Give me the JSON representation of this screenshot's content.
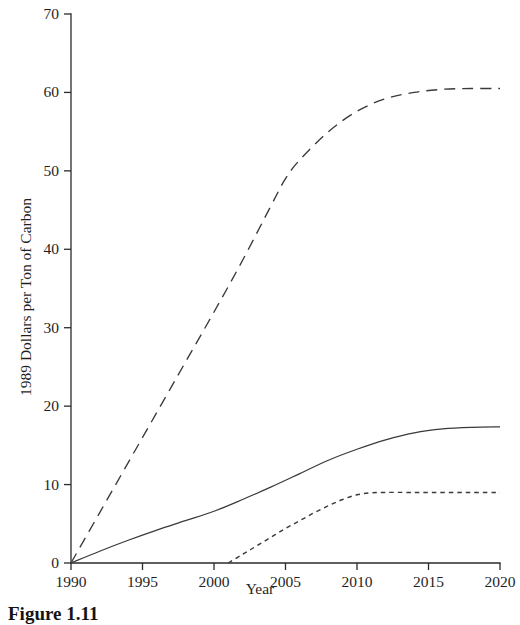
{
  "figure": {
    "caption": "Figure 1.11"
  },
  "chart_data": {
    "type": "line",
    "title": "",
    "xlabel": "Year",
    "ylabel": "1989 Dollars per Ton of Carbon",
    "xlim": [
      1990,
      2020
    ],
    "ylim": [
      0,
      70
    ],
    "xticks": [
      1990,
      1995,
      2000,
      2005,
      2010,
      2015,
      2020
    ],
    "xticklabels": [
      "1990",
      "1995",
      "2000",
      "2005",
      "2010",
      "2015",
      "2020"
    ],
    "yticks": [
      0,
      10,
      20,
      30,
      40,
      50,
      60,
      70
    ],
    "yticklabels": [
      "0",
      "10",
      "20",
      "30",
      "40",
      "50",
      "60",
      "70"
    ],
    "grid": false,
    "legend": "none",
    "series": [
      {
        "name": "upper-dashed",
        "style": "dashed",
        "x": [
          1990,
          1992,
          1994,
          1996,
          1998,
          2000,
          2002,
          2004,
          2005,
          2006,
          2008,
          2010,
          2012,
          2014,
          2016,
          2018,
          2020
        ],
        "values": [
          0,
          6.4,
          12.8,
          19.2,
          25.6,
          32.0,
          38.6,
          45.6,
          49.0,
          51.4,
          55.0,
          57.6,
          59.2,
          60.0,
          60.4,
          60.5,
          60.5
        ]
      },
      {
        "name": "middle-solid",
        "style": "solid",
        "x": [
          1990,
          1992,
          1994,
          1996,
          1998,
          2000,
          2002,
          2004,
          2006,
          2008,
          2010,
          2012,
          2014,
          2016,
          2018,
          2020
        ],
        "values": [
          0,
          1.5,
          2.9,
          4.2,
          5.4,
          6.6,
          8.1,
          9.7,
          11.4,
          13.1,
          14.5,
          15.7,
          16.6,
          17.1,
          17.3,
          17.35
        ]
      },
      {
        "name": "lower-dotted",
        "style": "dotted",
        "x": [
          2001,
          2002,
          2003,
          2004,
          2005,
          2006,
          2007,
          2008,
          2009,
          2010,
          2011,
          2012,
          2014,
          2016,
          2018,
          2020
        ],
        "values": [
          0,
          1.1,
          2.2,
          3.3,
          4.4,
          5.4,
          6.4,
          7.3,
          8.1,
          8.7,
          8.95,
          9.0,
          9.0,
          9.0,
          9.0,
          9.0
        ]
      }
    ]
  }
}
